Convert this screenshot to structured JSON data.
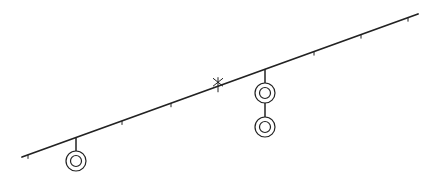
{
  "diagram": {
    "type": "line-with-hanging-rings",
    "colors": {
      "stroke": "#222222",
      "background": "#ffffff"
    },
    "main_line": {
      "x1": 22,
      "y1": 157,
      "x2": 418,
      "y2": 14
    },
    "ticks": [
      {
        "x": 28
      },
      {
        "x": 122
      },
      {
        "x": 171
      },
      {
        "x": 314
      },
      {
        "x": 361
      },
      {
        "x": 408
      }
    ],
    "cross_marker": {
      "x": 218,
      "label": ""
    },
    "hangers": [
      {
        "x": 76,
        "rings_y": [
          161
        ]
      },
      {
        "x": 265,
        "rings_y": [
          93,
          127
        ]
      }
    ]
  }
}
